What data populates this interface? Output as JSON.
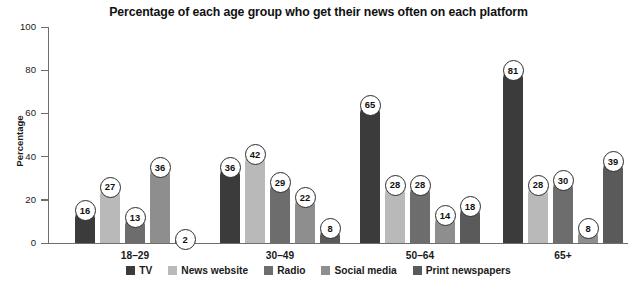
{
  "chart_data": {
    "type": "bar",
    "title": "Percentage of each age group who get their news often on each platform",
    "xlabel": "",
    "ylabel": "Percentage",
    "ylim": [
      0,
      100
    ],
    "yticks": [
      0,
      20,
      40,
      60,
      80,
      100
    ],
    "grid": false,
    "legend_position": "bottom",
    "categories": [
      "18–29",
      "30–49",
      "50–64",
      "65+"
    ],
    "series": [
      {
        "name": "TV",
        "color": "#3b3b3b",
        "values": [
          16,
          36,
          65,
          81
        ]
      },
      {
        "name": "News website",
        "color": "#b9b9b9",
        "values": [
          27,
          42,
          28,
          28
        ]
      },
      {
        "name": "Radio",
        "color": "#6d6d6d",
        "values": [
          13,
          29,
          28,
          30
        ]
      },
      {
        "name": "Social media",
        "color": "#8e8e8e",
        "values": [
          36,
          22,
          14,
          8
        ]
      },
      {
        "name": "Print newspapers",
        "color": "#5a5a5a",
        "values": [
          2,
          8,
          18,
          39
        ]
      }
    ]
  }
}
